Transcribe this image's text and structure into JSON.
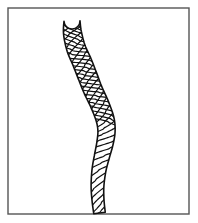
{
  "figure": {
    "title": "Braided rope illustration",
    "caption": "Line drawing of a twisted braided rope or cord in an S-curve",
    "subject": "rope",
    "style": "black and white line art, cross-hatched braid texture",
    "background_color": "#ffffff",
    "ink_color": "#1a1a1a"
  },
  "frame": {
    "name": "border-rectangle",
    "x": 8,
    "y": 8,
    "width": 181,
    "height": 206,
    "stroke_color": "#555555",
    "stroke_width": 1.4,
    "fill": "#ffffff"
  },
  "rope": {
    "stroke_color": "#111111",
    "outline_width": 1.6,
    "strand_width": 1.2,
    "fill": "#ffffff",
    "tip_label": "rounded top cap",
    "bottom_label": "cut end at frame base",
    "centerline": [
      {
        "t": 0.0,
        "x": 72.0,
        "y": 21.0,
        "w": 8.0
      },
      {
        "t": 0.06,
        "x": 72.5,
        "y": 33.0,
        "w": 9.0
      },
      {
        "t": 0.14,
        "x": 76.0,
        "y": 48.0,
        "w": 9.4
      },
      {
        "t": 0.22,
        "x": 82.0,
        "y": 62.0,
        "w": 9.6
      },
      {
        "t": 0.3,
        "x": 87.5,
        "y": 76.0,
        "w": 9.6
      },
      {
        "t": 0.38,
        "x": 93.0,
        "y": 90.0,
        "w": 9.4
      },
      {
        "t": 0.46,
        "x": 99.5,
        "y": 104.0,
        "w": 9.2
      },
      {
        "t": 0.54,
        "x": 105.0,
        "y": 119.0,
        "w": 9.0
      },
      {
        "t": 0.6,
        "x": 106.5,
        "y": 131.0,
        "w": 8.6
      },
      {
        "t": 0.66,
        "x": 105.0,
        "y": 143.0,
        "w": 8.2
      },
      {
        "t": 0.72,
        "x": 102.0,
        "y": 156.0,
        "w": 7.6
      },
      {
        "t": 0.8,
        "x": 99.0,
        "y": 170.0,
        "w": 7.0
      },
      {
        "t": 0.88,
        "x": 97.5,
        "y": 186.0,
        "w": 6.4
      },
      {
        "t": 0.95,
        "x": 98.0,
        "y": 200.0,
        "w": 6.0
      },
      {
        "t": 1.0,
        "x": 99.5,
        "y": 213.0,
        "w": 5.8
      }
    ],
    "texture": {
      "type": "double-helix-crosshatch",
      "primary_strand_count": 30,
      "secondary_strand_count": 26,
      "crosshatch_end_t": 0.56,
      "single_hatch_start_t": 0.56,
      "description": "crosshatched braid at the upper two-thirds, single diagonal strands toward the lower taper"
    }
  }
}
